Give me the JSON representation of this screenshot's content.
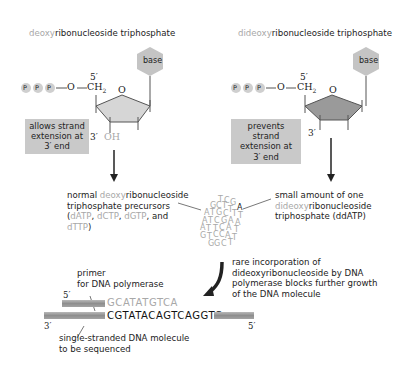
{
  "left_panel": {
    "title_prefix": "deoxy",
    "title_suffix": "ribonucleoside triphosphate",
    "base_label": "base",
    "phosphates": [
      "P",
      "P",
      "P"
    ],
    "linker_o": "O",
    "ch2": "CH",
    "ch2_sub": "2",
    "ring_o": "O",
    "five_prime": "5′",
    "three_prime": "3′",
    "oh_label": "OH",
    "callout": [
      "allows strand",
      "extension at",
      "3′ end"
    ],
    "ring_color": "#d6d6d6"
  },
  "right_panel": {
    "title_prefix": "dideoxy",
    "title_suffix": "ribonucleoside triphosphate",
    "base_label": "base",
    "phosphates": [
      "P",
      "P",
      "P"
    ],
    "linker_o": "O",
    "ch2": "CH",
    "ch2_sub": "2",
    "ring_o": "O",
    "five_prime": "5′",
    "three_prime": "3′",
    "callout": [
      "prevents strand",
      "extension at",
      "3′ end"
    ],
    "ring_color": "#9a9a9a"
  },
  "precursors_label": {
    "line1_a": "normal ",
    "line1_b": "deoxy",
    "line1_c": "ribonucleoside",
    "line2": "triphosphate precursors",
    "line3_a": "(",
    "line3_b": "dATP",
    "line3_c": ", ",
    "line3_d": "dCTP",
    "line3_e": ", ",
    "line3_f": "dGTP",
    "line3_g": ", and",
    "line4_a": "dTTP",
    "line4_b": ")"
  },
  "ddatp_label": {
    "line1": "small amount of one",
    "line2_a": "dideoxy",
    "line2_b": "ribonucleoside",
    "line3": "triphosphate (ddATP)"
  },
  "nucleotide_cluster": {
    "highlight_letter": "A",
    "letters": [
      "T",
      "C",
      "G",
      "A",
      "G",
      "C",
      "T",
      "T",
      "A",
      "T",
      "G",
      "C",
      "T",
      "T",
      "A",
      "T",
      "C",
      "G",
      "A",
      "A",
      "A",
      "T",
      "T",
      "C",
      "A",
      "T",
      "G",
      "T",
      "C",
      "C",
      "A",
      "T",
      "G",
      "G",
      "C",
      "T"
    ]
  },
  "incorporation_label": [
    "rare incorporation of",
    "dideoxyribonucleoside by DNA",
    "polymerase blocks further growth",
    "of the DNA molecule"
  ],
  "primer_label": [
    "primer",
    "for DNA polymerase"
  ],
  "template_label": [
    "single-stranded DNA molecule",
    "to be sequenced"
  ],
  "primer_strand": {
    "five_prime": "5′",
    "sequence": "GCATATGTCA"
  },
  "template_strand": {
    "three_prime": "3′",
    "five_prime": "5′",
    "sequence": "CGTATACAGTCAGGTC"
  },
  "colors": {
    "grey_text": "#a8a8a8",
    "callout_bg": "#c9c9c9",
    "base_hex": "#c4c4c4",
    "phosphate": "#cfcfcf",
    "arrow": "#222222"
  }
}
